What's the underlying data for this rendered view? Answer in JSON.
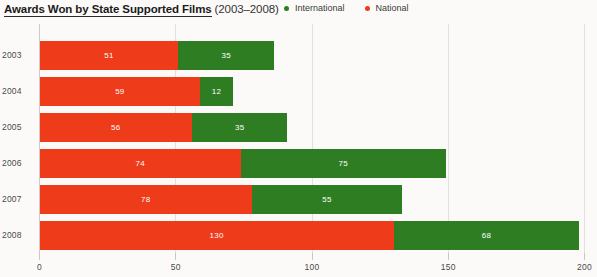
{
  "header": {
    "title_main": "Awards Won by State Supported Films",
    "title_sub": "(2003–2008)"
  },
  "legend": {
    "items": [
      {
        "label": "International",
        "color": "#2e7d23",
        "icon": "legend-dot-green"
      },
      {
        "label": "National",
        "color": "#ee3b1a",
        "icon": "legend-dot-red"
      }
    ]
  },
  "colors": {
    "national_red": "#ee3b1a",
    "international_green": "#2e7d23",
    "background": "#fbfaf8",
    "gridline": "#e3e0dc",
    "axis_text": "#4a4a4a"
  },
  "chart_data": {
    "type": "bar",
    "orientation": "horizontal",
    "stacked": true,
    "xlabel": "",
    "ylabel": "",
    "xlim": [
      0,
      200
    ],
    "xticks": [
      0,
      50,
      100,
      150,
      200
    ],
    "xtick_labels": [
      "0",
      "50",
      "100",
      "150",
      "200"
    ],
    "grid": true,
    "legend_position": "top-right",
    "categories": [
      "2003",
      "2004",
      "2005",
      "2006",
      "2007",
      "2008"
    ],
    "series": [
      {
        "name": "National",
        "color": "#ee3b1a",
        "values": [
          51,
          59,
          56,
          74,
          78,
          130
        ]
      },
      {
        "name": "International",
        "color": "#2e7d23",
        "values": [
          35,
          12,
          35,
          75,
          55,
          68
        ]
      }
    ],
    "totals": [
      86,
      71,
      91,
      149,
      133,
      198
    ]
  }
}
